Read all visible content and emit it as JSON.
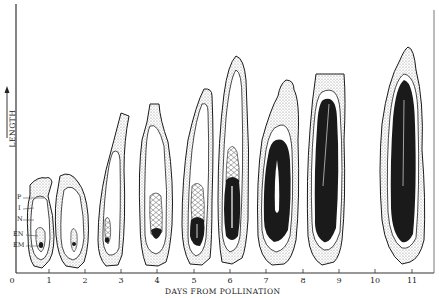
{
  "figure": {
    "y_axis_title": "LENGTH",
    "x_axis_title": "DAYS FROM POLLINATION",
    "x_ticks": [
      "0",
      "1",
      "2",
      "3",
      "4",
      "5",
      "6",
      "7",
      "8",
      "9",
      "10",
      "11"
    ],
    "part_labels": {
      "p": "P",
      "i": "I",
      "n": "N",
      "en": "EN",
      "em": "EM"
    },
    "stages": [
      {
        "day": "1",
        "description": "ovule with pericarp, integument, nucellus, small endosperm and embryo"
      },
      {
        "day": "2",
        "description": "ovule, embryo sac enlarging"
      },
      {
        "day": "3",
        "description": "elongated kernel, cellular endosperm with small embryo"
      },
      {
        "day": "4",
        "description": "larger cellular endosperm with embryo"
      },
      {
        "day": "5",
        "description": "embryo beginning to enlarge"
      },
      {
        "day": "6",
        "description": "embryo enlarging, endosperm above"
      },
      {
        "day": "7",
        "description": "embryo large, two-lobed"
      },
      {
        "day": "8",
        "description": "embryo nearly fills kernel"
      },
      {
        "day": "11",
        "description": "mature kernel, embryo fills cavity"
      }
    ],
    "colors": {
      "ink": "#1a1a1a",
      "stipple": "#c8c8c8",
      "paper": "#ffffff"
    }
  }
}
